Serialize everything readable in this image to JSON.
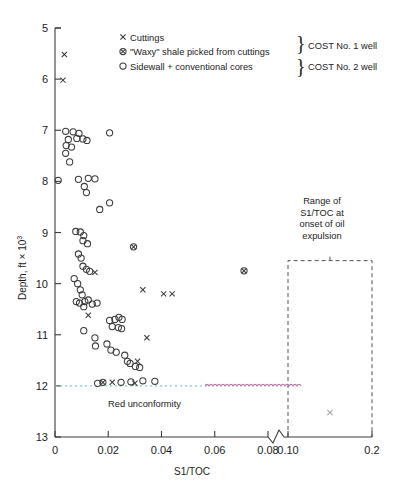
{
  "chart_data": {
    "type": "scatter",
    "title": "",
    "xlabel": "S1/TOC",
    "ylabel": "Depth, ft × 10³",
    "ylabel_base": "Depth, ft × 10",
    "ylabel_exp": "3",
    "xlim": [
      0,
      0.2
    ],
    "ylim": [
      5,
      13
    ],
    "y_inverted": true,
    "grid": false,
    "axis_break": {
      "present": true,
      "between": [
        0.08,
        0.1
      ],
      "symbol": "zigzag"
    },
    "xticks": [
      "0",
      "0.02",
      "0.04",
      "0.06",
      "0.08",
      "0.10",
      "0.2"
    ],
    "xtick_values": [
      0,
      0.02,
      0.04,
      0.06,
      0.08,
      0.1,
      0.2
    ],
    "yticks": [
      "5",
      "6",
      "7",
      "8",
      "9",
      "10",
      "11",
      "12",
      "13"
    ],
    "ytick_values": [
      5,
      6,
      7,
      8,
      9,
      10,
      11,
      12,
      13
    ],
    "legend_position": "top-right",
    "series": [
      {
        "name": "Cuttings",
        "marker": "x",
        "well": "COST No. 1 well",
        "points": [
          [
            0.0035,
            5.52
          ],
          [
            0.003,
            6.02
          ],
          [
            0.015,
            9.78
          ],
          [
            0.0125,
            10.62
          ],
          [
            0.033,
            10.12
          ],
          [
            0.0408,
            10.2
          ],
          [
            0.044,
            10.2
          ],
          [
            0.0345,
            11.06
          ],
          [
            0.031,
            11.52
          ],
          [
            0.0215,
            11.93
          ],
          [
            0.03,
            11.95
          ],
          [
            0.15,
            12.52
          ]
        ]
      },
      {
        "name": "\"Waxy\" shale picked from cuttings",
        "marker": "circle-x",
        "well": "COST No. 1 well",
        "points": [
          [
            0.0295,
            9.28
          ],
          [
            0.071,
            9.75
          ],
          [
            0.018,
            11.93
          ]
        ]
      },
      {
        "name": "Sidewall + conventional cores",
        "marker": "o",
        "well": "COST No. 2 well",
        "points": [
          [
            0.004,
            7.02
          ],
          [
            0.0068,
            7.03
          ],
          [
            0.009,
            7.06
          ],
          [
            0.0205,
            7.05
          ],
          [
            0.005,
            7.18
          ],
          [
            0.0082,
            7.16
          ],
          [
            0.0105,
            7.17
          ],
          [
            0.012,
            7.2
          ],
          [
            0.0042,
            7.3
          ],
          [
            0.0062,
            7.33
          ],
          [
            0.004,
            7.45
          ],
          [
            0.0055,
            7.62
          ],
          [
            0.0012,
            7.98
          ],
          [
            0.0088,
            7.96
          ],
          [
            0.0125,
            7.94
          ],
          [
            0.015,
            7.95
          ],
          [
            0.011,
            8.1
          ],
          [
            0.0118,
            8.22
          ],
          [
            0.0168,
            8.55
          ],
          [
            0.0205,
            8.42
          ],
          [
            0.0078,
            8.98
          ],
          [
            0.0095,
            8.99
          ],
          [
            0.0108,
            9.06
          ],
          [
            0.0105,
            9.16
          ],
          [
            0.0122,
            9.22
          ],
          [
            0.0088,
            9.42
          ],
          [
            0.0098,
            9.5
          ],
          [
            0.0105,
            9.66
          ],
          [
            0.0118,
            9.72
          ],
          [
            0.013,
            9.76
          ],
          [
            0.0072,
            9.9
          ],
          [
            0.0085,
            10.0
          ],
          [
            0.0095,
            10.12
          ],
          [
            0.0102,
            10.22
          ],
          [
            0.008,
            10.35
          ],
          [
            0.0092,
            10.38
          ],
          [
            0.0112,
            10.35
          ],
          [
            0.0125,
            10.32
          ],
          [
            0.0108,
            10.45
          ],
          [
            0.014,
            10.4
          ],
          [
            0.0158,
            10.38
          ],
          [
            0.0205,
            10.72
          ],
          [
            0.0225,
            10.7
          ],
          [
            0.024,
            10.66
          ],
          [
            0.0252,
            10.7
          ],
          [
            0.0215,
            10.84
          ],
          [
            0.0238,
            10.86
          ],
          [
            0.025,
            10.88
          ],
          [
            0.0108,
            10.92
          ],
          [
            0.015,
            11.06
          ],
          [
            0.0152,
            11.22
          ],
          [
            0.0195,
            11.18
          ],
          [
            0.021,
            11.3
          ],
          [
            0.023,
            11.34
          ],
          [
            0.0262,
            11.4
          ],
          [
            0.0272,
            11.52
          ],
          [
            0.0282,
            11.56
          ],
          [
            0.0302,
            11.62
          ],
          [
            0.0318,
            11.64
          ],
          [
            0.016,
            11.95
          ],
          [
            0.0248,
            11.93
          ],
          [
            0.0285,
            11.92
          ],
          [
            0.033,
            11.9
          ],
          [
            0.0375,
            11.91
          ]
        ]
      }
    ],
    "annotations": [
      {
        "name": "range-box-label",
        "lines": [
          "Range of",
          "S1/TOC at",
          "onset of oil",
          "expulsion"
        ],
        "box": {
          "x_from": 0.1,
          "x_to": 0.2,
          "y_from": 9.55,
          "y_to": 13,
          "style": "dashed"
        }
      },
      {
        "name": "red-unconformity",
        "text": "Red unconformity",
        "depth": 12.0,
        "line_styles": [
          "dotted-cyan",
          "wavy-magenta"
        ],
        "colors": {
          "dotted": "#6fc9c4",
          "wavy": "#b06fa8"
        }
      }
    ]
  },
  "legend": {
    "entries": [
      {
        "marker": "x",
        "label": "Cuttings"
      },
      {
        "marker": "circle-x",
        "label": "\"Waxy\" shale picked from cuttings"
      },
      {
        "marker": "o",
        "label": "Sidewall + conventional cores"
      }
    ],
    "braces": [
      {
        "label": "COST No. 1 well"
      },
      {
        "label": "COST No. 2 well"
      }
    ]
  },
  "colors": {
    "axis": "#3a3a3a",
    "marker": "#3a3a3a",
    "text": "#1a1a1a",
    "dotted_line": "#7ecfc8",
    "wavy_line": "#b678ab",
    "dashed_box": "#555555"
  }
}
